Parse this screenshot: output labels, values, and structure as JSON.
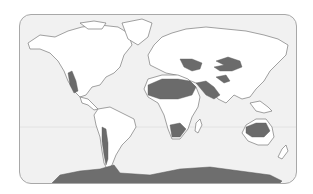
{
  "map": {
    "title": "World deserts map",
    "theme": "Desert regions of the world",
    "colors": {
      "ocean": "#f1f1f1",
      "land": "#ffffff",
      "desert": "#6b6b6b",
      "coastline": "#7a7a7a",
      "frame": "#a8a8a8"
    },
    "desert_regions": [
      {
        "name": "Great Basin / Mojave / Sonoran",
        "continent": "North America"
      },
      {
        "name": "Atacama / Patagonian",
        "continent": "South America"
      },
      {
        "name": "Sahara",
        "continent": "Africa"
      },
      {
        "name": "Kalahari / Namib",
        "continent": "Africa"
      },
      {
        "name": "Arabian",
        "continent": "Asia"
      },
      {
        "name": "Iranian / Thar",
        "continent": "Asia"
      },
      {
        "name": "Karakum / Kyzylkum",
        "continent": "Asia"
      },
      {
        "name": "Gobi / Taklamakan",
        "continent": "Asia"
      },
      {
        "name": "Australian",
        "continent": "Australia"
      },
      {
        "name": "Antarctic polar desert",
        "continent": "Antarctica"
      }
    ]
  }
}
